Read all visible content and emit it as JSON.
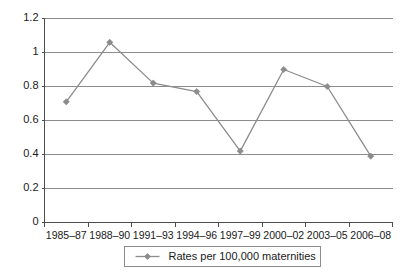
{
  "chart_data": {
    "type": "line",
    "title": "",
    "subtitle": "",
    "xlabel": "",
    "ylabel": "",
    "categories": [
      "1985–87",
      "1988–90",
      "1991–93",
      "1994–96",
      "1997–99",
      "2000–02",
      "2003–05",
      "2006–08"
    ],
    "series": [
      {
        "name": "Rates per 100,000 maternities",
        "values": [
          0.71,
          1.06,
          0.82,
          0.77,
          0.42,
          0.9,
          0.8,
          0.39
        ]
      }
    ],
    "ylim": [
      0,
      1.2
    ],
    "ytick_values": [
      0,
      0.2,
      0.4,
      0.6,
      0.8,
      1,
      1.2
    ],
    "ytick_labels": [
      "0",
      "0.2",
      "0.4",
      "0.6",
      "0.8",
      "1",
      "1.2"
    ],
    "grid": true,
    "grid_axis": "y",
    "legend": {
      "position": "bottom",
      "entries": [
        "Rates per 100,000 maternities"
      ]
    },
    "colors": {
      "series": "#8c8c8c",
      "gridline": "#8c8c8c",
      "axis": "#4d4d4d",
      "text": "#1a1a1a",
      "background": "#ffffff"
    },
    "marker": "diamond"
  }
}
